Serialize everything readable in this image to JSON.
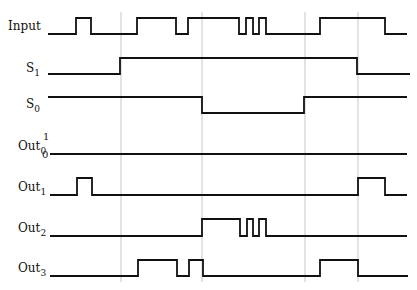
{
  "diagram": {
    "type": "timing-diagram",
    "guide_lines_x": [
      121,
      202,
      305,
      358
    ],
    "signals": [
      {
        "name": "Input",
        "base": "Input",
        "subscript": "",
        "label_x": 8,
        "label_y": 30,
        "low_y": 34,
        "high_y": 18,
        "x_start": 48,
        "x_end": 407,
        "initial": 0,
        "edges": [
          76,
          91,
          137,
          176,
          188,
          239,
          246,
          253,
          259,
          266,
          320,
          385
        ]
      },
      {
        "name": "S1",
        "base": "S",
        "subscript": "1",
        "label_x": 26,
        "label_y": 72,
        "low_y": 74,
        "high_y": 58,
        "x_start": 48,
        "x_end": 410,
        "initial": 0,
        "edges": [
          120,
          357
        ]
      },
      {
        "name": "S0",
        "base": "S",
        "subscript": "0",
        "label_x": 26,
        "label_y": 108,
        "low_y": 113,
        "high_y": 97,
        "x_start": 48,
        "x_end": 407,
        "initial": 1,
        "edges": [
          202,
          304
        ]
      },
      {
        "name": "Out0",
        "base": "Out",
        "subscript": "0",
        "label_x": 18,
        "label_y": 150,
        "low_y": 154,
        "high_y": 138,
        "x_start": 50,
        "x_end": 407,
        "initial": 0,
        "edges": []
      },
      {
        "name": "Out1",
        "base": "Out",
        "subscript": "1",
        "label_x": 18,
        "label_y": 191,
        "low_y": 195,
        "high_y": 178,
        "x_start": 50,
        "x_end": 407,
        "initial": 0,
        "edges": [
          77,
          92,
          358,
          385
        ]
      },
      {
        "name": "Out2",
        "base": "Out",
        "subscript": "2",
        "label_x": 18,
        "label_y": 232,
        "low_y": 236,
        "high_y": 219,
        "x_start": 50,
        "x_end": 407,
        "initial": 0,
        "edges": [
          202,
          240,
          247,
          253,
          259,
          266
        ]
      },
      {
        "name": "Out3",
        "base": "Out",
        "subscript": "3",
        "label_x": 18,
        "label_y": 272,
        "low_y": 276,
        "high_y": 260,
        "x_start": 50,
        "x_end": 408,
        "initial": 0,
        "edges": [
          138,
          177,
          189,
          203,
          320,
          358
        ]
      }
    ],
    "level_ticks": {
      "one": "1",
      "zero": "0",
      "one_x": 43,
      "one_y": 140,
      "zero_x": 42,
      "zero_y": 158
    }
  }
}
